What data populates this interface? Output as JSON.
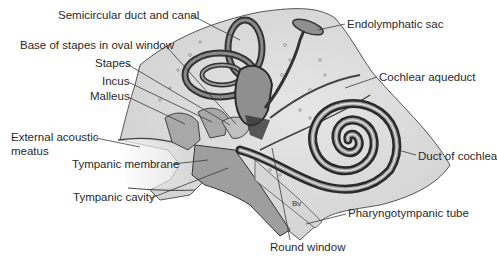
{
  "figure": {
    "annotation": "Bv",
    "colors": {
      "background": "#ffffff",
      "bone": "#d9d9d9",
      "bone_dark": "#bdbdbd",
      "duct_dark": "#3a3a3a",
      "duct_mid": "#7a7a7a",
      "duct_light": "#c8c8c8",
      "leader_line": "#3a3a3a",
      "label_text": "#2a2a2a"
    }
  },
  "labels": {
    "semicircular": "Semicircular duct and canal",
    "base_stapes": "Base of stapes in oval window",
    "stapes": "Stapes",
    "incus": "Incus",
    "malleus": "Malleus",
    "external_1": "External acoustic",
    "external_2": "meatus",
    "tympanic_membrane": "Tympanic membrane",
    "tympanic_cavity": "Tympanic cavity",
    "endolymphatic": "Endolymphatic sac",
    "cochlear_aqueduct": "Cochlear aqueduct",
    "duct_cochlea": "Duct of cochlea",
    "pharyngotympanic": "Pharyngotympanic tube",
    "round_window": "Round window"
  }
}
